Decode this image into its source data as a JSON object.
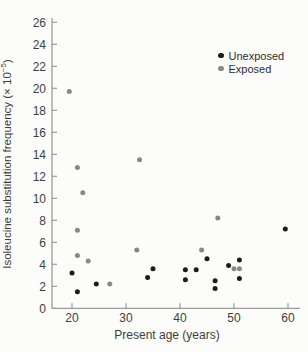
{
  "figure": {
    "ylabel_prefix": "Isoleucine substitution frequency (× 10",
    "ylabel_superscript": "−5",
    "ylabel_suffix": ")"
  },
  "chart_data": {
    "type": "scatter",
    "title": "",
    "xlabel": "Present age (years)",
    "ylabel": "Isoleucine substitution frequency (× 10^−5)",
    "xlim": [
      17,
      62
    ],
    "ylim": [
      0,
      26
    ],
    "xticks": [
      20,
      30,
      40,
      50,
      60
    ],
    "yticks": [
      0,
      2,
      4,
      6,
      8,
      10,
      12,
      14,
      16,
      18,
      20,
      22,
      24,
      26
    ],
    "grid": false,
    "legend_position": "top-right",
    "colors": {
      "axis": "#9b9b9b",
      "tick_text": "#3e3e3e",
      "background": "#fcfcfa"
    },
    "series": [
      {
        "name": "Unexposed",
        "color": "#1c1c1c",
        "points": [
          [
            20,
            3.2
          ],
          [
            21,
            1.5
          ],
          [
            24.5,
            2.2
          ],
          [
            34,
            2.8
          ],
          [
            35,
            3.6
          ],
          [
            41,
            3.5
          ],
          [
            41,
            2.6
          ],
          [
            43,
            3.5
          ],
          [
            45,
            4.5
          ],
          [
            46.5,
            2.5
          ],
          [
            46.5,
            1.8
          ],
          [
            49,
            3.9
          ],
          [
            51,
            4.4
          ],
          [
            51,
            2.7
          ],
          [
            59.5,
            7.2
          ]
        ]
      },
      {
        "name": "Exposed",
        "color": "#888888",
        "points": [
          [
            19.5,
            19.7
          ],
          [
            21,
            12.8
          ],
          [
            22,
            10.5
          ],
          [
            21,
            7.1
          ],
          [
            21,
            4.8
          ],
          [
            23,
            4.3
          ],
          [
            27,
            2.2
          ],
          [
            32.5,
            13.5
          ],
          [
            32,
            5.3
          ],
          [
            44,
            5.3
          ],
          [
            47,
            8.2
          ],
          [
            50,
            3.6
          ],
          [
            51,
            3.6
          ]
        ]
      }
    ]
  }
}
